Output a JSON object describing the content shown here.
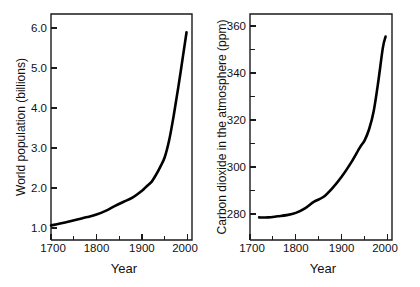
{
  "figure": {
    "background": "#ffffff",
    "ink_color": "#000000",
    "panel_count": 2
  },
  "chart_data": [
    {
      "type": "line",
      "panel": "left",
      "title": "",
      "xlabel": "Year",
      "ylabel": "World population  (billions)",
      "xlim": [
        1700,
        2010
      ],
      "ylim": [
        0.25,
        6.45
      ],
      "grid": false,
      "legend": null,
      "xticks": [
        1700,
        1800,
        1900,
        2000
      ],
      "xticklabels": [
        "1700",
        "1800",
        "1900",
        "2000"
      ],
      "xticks_minor": [
        1750,
        1850,
        1950
      ],
      "yticks": [
        1.0,
        2.0,
        3.0,
        4.0,
        5.0,
        6.0
      ],
      "yticklabels": [
        "1.0",
        "2.0",
        "3.0",
        "4.0",
        "5.0",
        "6.0"
      ],
      "series": [
        {
          "name": "World population",
          "x": [
            1700,
            1720,
            1740,
            1760,
            1780,
            1800,
            1820,
            1840,
            1860,
            1880,
            1900,
            1910,
            1920,
            1930,
            1940,
            1950,
            1960,
            1970,
            1980,
            1990,
            1998
          ],
          "values": [
            0.65,
            0.7,
            0.76,
            0.82,
            0.88,
            0.95,
            1.05,
            1.18,
            1.3,
            1.42,
            1.6,
            1.72,
            1.83,
            2.02,
            2.25,
            2.52,
            3.0,
            3.68,
            4.45,
            5.28,
            5.95
          ]
        }
      ]
    },
    {
      "type": "line",
      "panel": "right",
      "title": "",
      "xlabel": "Year",
      "ylabel": "Carbon dioxide in the atmosphere (ppm)",
      "xlim": [
        1700,
        2010
      ],
      "ylim": [
        268,
        368
      ],
      "grid": false,
      "legend": null,
      "xticks": [
        1700,
        1800,
        1900,
        2000
      ],
      "xticklabels": [
        "1700",
        "1800",
        "1900",
        "2000"
      ],
      "xticks_minor": [
        1750,
        1850,
        1950
      ],
      "yticks": [
        280,
        300,
        320,
        340,
        360
      ],
      "yticklabels": [
        "280",
        "300",
        "320",
        "340",
        "360"
      ],
      "yticks_minor": [
        290,
        310,
        330,
        350
      ],
      "series": [
        {
          "name": "Atmospheric CO2",
          "x": [
            1720,
            1740,
            1760,
            1780,
            1800,
            1820,
            1840,
            1860,
            1880,
            1900,
            1920,
            1940,
            1950,
            1960,
            1970,
            1980,
            1990,
            1996
          ],
          "values": [
            278,
            278,
            278.5,
            279,
            280,
            282,
            285,
            287,
            291,
            296,
            302,
            309,
            312,
            317,
            325,
            338,
            353,
            358
          ]
        }
      ]
    }
  ]
}
